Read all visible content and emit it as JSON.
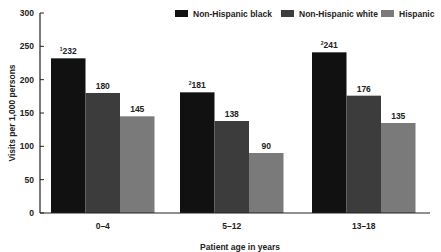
{
  "chart_data": {
    "type": "bar",
    "title": "",
    "xlabel": "Patient age in years",
    "ylabel": "Visits per 1,000 persons",
    "ylim": [
      0,
      300
    ],
    "yticks": [
      0,
      50,
      100,
      150,
      200,
      250,
      300
    ],
    "ytick_labels": [
      "0",
      "50",
      "100",
      "150",
      "200",
      "250",
      "300"
    ],
    "grid": false,
    "legend_position": "top-right",
    "categories": [
      "0–4",
      "5–12",
      "13–18"
    ],
    "series": [
      {
        "name": "Non-Hispanic black",
        "color": "#111111",
        "values": [
          232,
          181,
          241
        ],
        "labels": [
          "232",
          "181",
          "241"
        ],
        "footnotes": [
          "1",
          "2",
          "2"
        ]
      },
      {
        "name": "Non-Hispanic white",
        "color": "#3c3c3c",
        "values": [
          180,
          138,
          176
        ],
        "labels": [
          "180",
          "138",
          "176"
        ],
        "footnotes": [
          "",
          "",
          ""
        ]
      },
      {
        "name": "Hispanic",
        "color": "#7a7a7a",
        "values": [
          145,
          90,
          135
        ],
        "labels": [
          "145",
          "90",
          "135"
        ],
        "footnotes": [
          "",
          "",
          ""
        ]
      }
    ]
  }
}
